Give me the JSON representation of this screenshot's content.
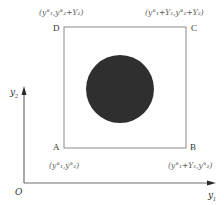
{
  "diagram": {
    "type": "geometric-coordinate-diagram",
    "colors": {
      "square_stroke": "#8a8a8a",
      "axis_stroke": "#6e6e6e",
      "circle_fill": "#2f2f2f",
      "background": "#ffffff"
    },
    "axes": {
      "origin_label": "O",
      "x_label": "y",
      "x_sub": "1",
      "y_label": "y",
      "y_sub": "2"
    },
    "corners": {
      "A": {
        "label": "A",
        "coord": "(y°₁,y°₂)"
      },
      "B": {
        "label": "B",
        "coord": "(y°₁+Y₁,y°₂)"
      },
      "C": {
        "label": "C",
        "coord": "(y°₁+Y₁,y°₂+Y₂)"
      },
      "D": {
        "label": "D",
        "coord": "(y°₁,y°₂+Y₂)"
      }
    },
    "shapes": {
      "square": {
        "x": 64,
        "y": 27,
        "width": 122,
        "height": 121
      },
      "circle": {
        "cx": 120,
        "cy": 89,
        "r": 34
      }
    }
  }
}
